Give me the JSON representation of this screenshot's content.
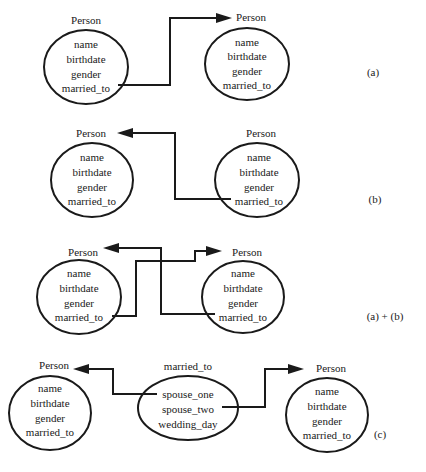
{
  "entity_title": "Person",
  "attributes": [
    "name",
    "birthdate",
    "gender",
    "married_to"
  ],
  "relationship": {
    "title": "married_to",
    "attributes": [
      "spouse_one",
      "spouse_two",
      "wedding_day"
    ]
  },
  "panels": [
    {
      "id": "a",
      "label": "(a)"
    },
    {
      "id": "b",
      "label": "(b)"
    },
    {
      "id": "ab",
      "label": "(a) + (b)"
    },
    {
      "id": "c",
      "label": "(c)"
    }
  ],
  "colors": {
    "ink": "#1a1a1a",
    "background": "#ffffff"
  }
}
